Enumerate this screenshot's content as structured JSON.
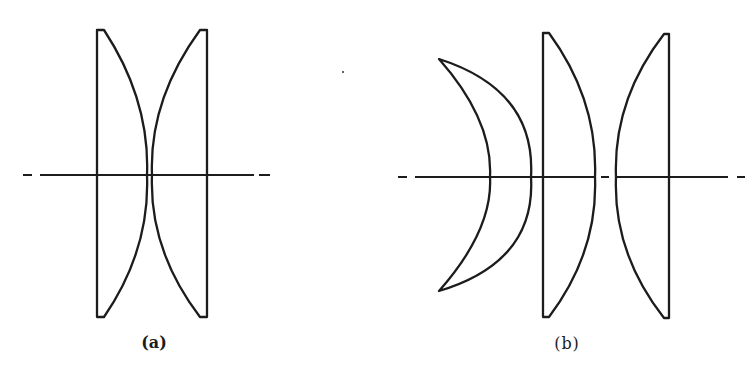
{
  "figure": {
    "colors": {
      "stroke": "#1c1c1c",
      "background": "#ffffff"
    },
    "panels": [
      {
        "id": "a",
        "label": "(a)",
        "description": "Two plano-convex lenses with convex surfaces nearly touching on the optical axis",
        "optical_axis": {
          "y": 175,
          "segments": [
            [
              23,
              32
            ],
            [
              40,
              254
            ],
            [
              259,
              270
            ]
          ]
        },
        "lenses": [
          {
            "name": "plano-convex-left",
            "type": "plano-convex",
            "path": "M97,30 L104,30 Q150,100 147,175 Q150,250 104,317 L97,317 Z"
          },
          {
            "name": "plano-convex-right",
            "type": "plano-convex",
            "path": "M207,30 L200,30 Q149,100 152,175 Q149,250 200,317 L207,317 Z"
          }
        ]
      },
      {
        "id": "b",
        "label": "(b)",
        "description": "Meniscus lens followed by two plano-convex lenses",
        "optical_axis": {
          "y": 177,
          "segments": [
            [
              398,
              407
            ],
            [
              415,
              595
            ],
            [
              601,
              609
            ],
            [
              616,
              728
            ],
            [
              737,
              745
            ]
          ]
        },
        "lenses": [
          {
            "name": "meniscus",
            "type": "meniscus",
            "path": "M439,59 Q536,90 531,177 Q536,262 439,291 Q493,230 490,177 Q493,120 439,59 Z"
          },
          {
            "name": "plano-convex-middle",
            "type": "plano-convex",
            "path": "M543,33 L549,33 Q598,100 595,177 Q598,252 549,317 L543,317 Z"
          },
          {
            "name": "plano-convex-right",
            "type": "plano-convex",
            "path": "M669,34 L664,34 Q613,100 616,177 Q613,253 664,318 L669,318 Z"
          }
        ]
      }
    ]
  }
}
